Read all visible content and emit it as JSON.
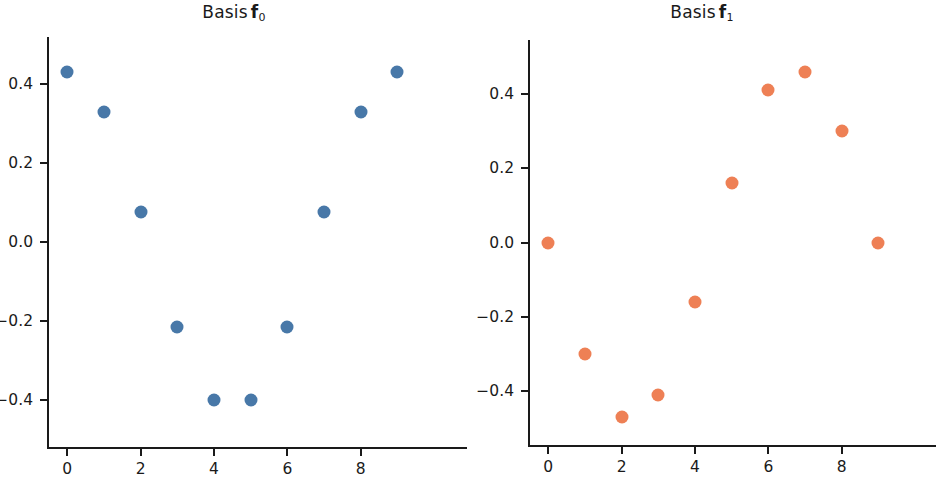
{
  "figure": {
    "width": 936,
    "height": 483,
    "background": "#ffffff"
  },
  "panels": [
    {
      "id": "basis-f0",
      "title_prefix": "Basis",
      "title_symbol": "f",
      "title_subscript": "0",
      "color": "#4878a8",
      "x_ticklabels": [
        "0",
        "2",
        "4",
        "6",
        "8"
      ],
      "y_ticklabels": [
        "0.4",
        "0.2",
        "0.0",
        "−0.2",
        "−0.4"
      ]
    },
    {
      "id": "basis-f1",
      "title_prefix": "Basis",
      "title_symbol": "f",
      "title_subscript": "1",
      "color": "#ee8055",
      "x_ticklabels": [
        "0",
        "2",
        "4",
        "6",
        "8"
      ],
      "y_ticklabels": [
        "0.4",
        "0.2",
        "0.0",
        "−0.2",
        "−0.4"
      ]
    }
  ],
  "chart_data": [
    {
      "type": "scatter",
      "title": "Basis f0",
      "xlabel": "",
      "ylabel": "",
      "color": "#4878a8",
      "marker": "circle",
      "grid": false,
      "legend": false,
      "x": [
        0,
        1,
        2,
        3,
        4,
        5,
        6,
        7,
        8,
        9
      ],
      "y": [
        0.43,
        0.33,
        0.075,
        -0.215,
        -0.4,
        -0.4,
        -0.215,
        0.075,
        0.33,
        0.43
      ],
      "xticks": [
        0,
        2,
        4,
        6,
        8
      ],
      "yticks": [
        0.4,
        0.2,
        0.0,
        -0.2,
        -0.4
      ],
      "xlim": [
        -0.55,
        9.75
      ],
      "ylim": [
        -0.52,
        0.52
      ]
    },
    {
      "type": "scatter",
      "title": "Basis f1",
      "xlabel": "",
      "ylabel": "",
      "color": "#ee8055",
      "marker": "circle",
      "grid": false,
      "legend": false,
      "x": [
        0,
        1,
        2,
        3,
        4,
        5,
        6,
        7,
        8,
        9
      ],
      "y": [
        0.0,
        -0.3,
        -0.47,
        -0.41,
        -0.16,
        0.16,
        0.41,
        0.46,
        0.3,
        0.0
      ],
      "xticks": [
        0,
        2,
        4,
        6,
        8
      ],
      "yticks": [
        0.4,
        0.2,
        0.0,
        -0.2,
        -0.4
      ],
      "xlim": [
        -0.55,
        9.75
      ],
      "ylim": [
        -0.545,
        0.545
      ]
    }
  ]
}
